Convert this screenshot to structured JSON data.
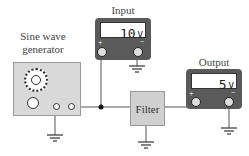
{
  "generator": {
    "label_line1": "Sine wave",
    "label_line2": "generator"
  },
  "input_meter": {
    "label": "Input",
    "value": "10",
    "unit": "V",
    "plus": "+",
    "minus": "−"
  },
  "output_meter": {
    "label": "Output",
    "value": "5",
    "unit": "V",
    "plus": "+",
    "minus": "−"
  },
  "filter": {
    "label": "Filter"
  },
  "colors": {
    "meter_body": "#5a5a5a",
    "box_fill": "#d9d9d9",
    "wire": "#555555"
  }
}
